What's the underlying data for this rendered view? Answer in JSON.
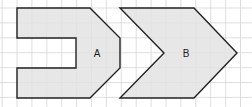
{
  "diagram": {
    "grid": {
      "spacing": 14.9,
      "color": "#d6d6d6"
    },
    "shapes": [
      {
        "label": "A",
        "fill": "#e3e3e3",
        "stroke": "#222222",
        "points": "17,8 90,8 120,38 120,68 90,98 17,98 17,68 76,68 76,38 17,38",
        "label_pos": [
          97,
          57
        ]
      },
      {
        "label": "B",
        "fill": "#e3e3e3",
        "stroke": "#222222",
        "points": "120,8 194,8 237,53 194,98 120,98 164,53",
        "label_pos": [
          186,
          57
        ]
      }
    ]
  }
}
